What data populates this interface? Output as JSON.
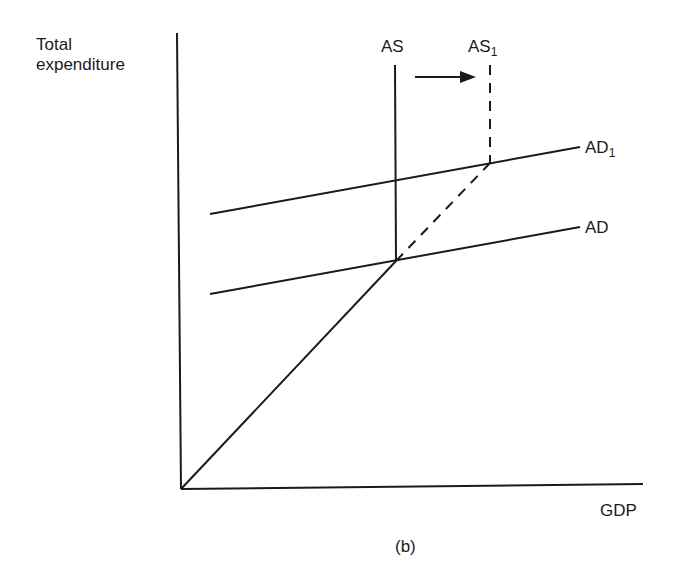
{
  "diagram": {
    "type": "economics-aggregate-supply-demand",
    "caption": "(b)",
    "axes": {
      "y_label_line1": "Total",
      "y_label_line2": "expenditure",
      "x_label": "GDP"
    },
    "curves": {
      "as": {
        "label": "AS",
        "style": "solid",
        "orientation": "vertical"
      },
      "as1": {
        "label": "AS",
        "subscript": "1",
        "style": "dashed",
        "orientation": "vertical"
      },
      "ad": {
        "label": "AD",
        "style": "solid",
        "orientation": "upward-sloping"
      },
      "ad1": {
        "label": "AD",
        "subscript": "1",
        "style": "solid",
        "orientation": "upward-sloping"
      },
      "supply_path": {
        "label": "",
        "style": "solid",
        "description": "45-degree-like line from origin to AS/AD intersection"
      },
      "supply_path_extension": {
        "label": "",
        "style": "dashed",
        "description": "extension from AS/AD intersection to AS1/AD1 intersection"
      }
    },
    "annotations": {
      "shift_arrow": {
        "direction": "right",
        "from": "AS",
        "to": "AS1"
      }
    },
    "colors": {
      "ink": "#1a1a1a",
      "background": "#ffffff"
    }
  }
}
